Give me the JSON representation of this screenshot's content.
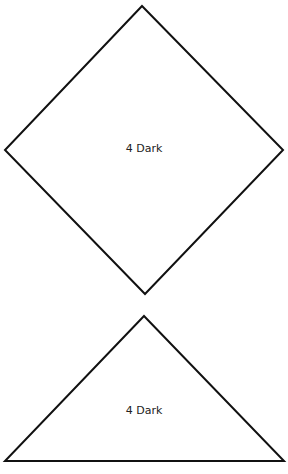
{
  "shapes": [
    {
      "type": "diamond",
      "label": "4 Dark"
    },
    {
      "type": "triangle",
      "label": "4 Dark"
    }
  ],
  "colors": {
    "stroke": "#111111",
    "fill": "#ffffff",
    "text": "#222222"
  }
}
